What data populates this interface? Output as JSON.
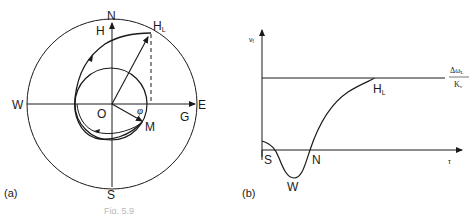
{
  "figure": {
    "panel_a": {
      "tag": "(a)",
      "compass": {
        "north": "N",
        "south": "S",
        "east": "E",
        "west": "W"
      },
      "origin": "O",
      "labels": {
        "H": "H",
        "HL_main": "H",
        "HL_sub": "L",
        "G": "G",
        "M": "M",
        "phi": "φ"
      }
    },
    "panel_b": {
      "tag": "(b)",
      "y_axis": {
        "main": "v",
        "sub": "f"
      },
      "x_axis": "τ",
      "asymptote": {
        "numerator": "Δω",
        "numerator_sub": "L",
        "denominator": "K",
        "denominator_sub": "v"
      },
      "points": {
        "S": "S",
        "W": "W",
        "N": "N",
        "HL_main": "H",
        "HL_sub": "L"
      }
    },
    "caption_partial": "Fig. 5.9"
  }
}
